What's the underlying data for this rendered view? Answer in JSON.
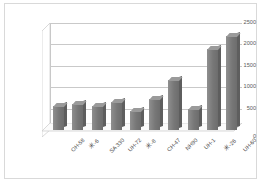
{
  "chart_data": {
    "type": "bar",
    "title": "",
    "xlabel": "",
    "ylabel": "",
    "categories": [
      "OH-58",
      "米-6",
      "SA 330",
      "UH-72",
      "米-8",
      "CH-47",
      "NH90",
      "UH-1",
      "米-26",
      "UH-60"
    ],
    "values": [
      550,
      600,
      570,
      650,
      450,
      720,
      1180,
      490,
      1900,
      2200
    ],
    "ylim": [
      0,
      2500
    ],
    "yticks": [
      0,
      500,
      1000,
      1500,
      2000,
      2500
    ],
    "ytick_labels": [
      "0",
      "500",
      "1000",
      "1500",
      "2000",
      "2500"
    ],
    "grid": true,
    "legend": false,
    "style": "3d-column",
    "colors": {
      "bar_face": "#777777",
      "bar_side": "#5e5e5e",
      "bar_top": "#9a9a9a",
      "gridline": "#c9c9c9",
      "plot_background": "#ffffff",
      "border": "#d9d9d9",
      "tick_text": "#595959"
    }
  }
}
